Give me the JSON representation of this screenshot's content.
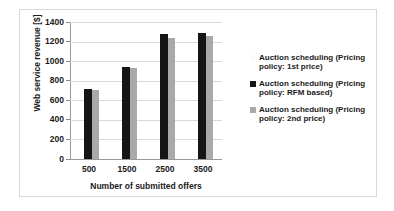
{
  "chart_data": {
    "type": "bar",
    "title": "",
    "subtitle": "",
    "xlabel": "Number of submitted offers",
    "ylabel": "Web service revenue [$]",
    "categories": [
      "500",
      "1500",
      "2500",
      "3500"
    ],
    "ylim": [
      0,
      1400
    ],
    "ytick_step": 200,
    "yticks": [
      "1400",
      "1200",
      "1000",
      "800",
      "600",
      "400",
      "200",
      "0"
    ],
    "grid": "horizontal",
    "legend_position": "right",
    "series": [
      {
        "name": "Auction scheduling (Pricing policy: 1st price)",
        "color": "#fdfdfd",
        "values": [
          0,
          0,
          0,
          0
        ]
      },
      {
        "name": "Auction scheduling (Pricing policy: RFM based)",
        "color": "#151515",
        "values": [
          715,
          940,
          1280,
          1292
        ]
      },
      {
        "name": "Auction scheduling (Pricing policy: 2nd price)",
        "color": "#a9a9a9",
        "values": [
          705,
          925,
          1240,
          1252
        ]
      }
    ]
  },
  "legend": {
    "items": [
      {
        "label": "Auction scheduling (Pricing policy: 1st price)",
        "swatch": "legend-swatch-1st-price"
      },
      {
        "label": "Auction scheduling (Pricing policy: RFM based)",
        "swatch": "legend-swatch-rfm-based"
      },
      {
        "label": "Auction scheduling (Pricing policy: 2nd price)",
        "swatch": "legend-swatch-2nd-price"
      }
    ]
  }
}
